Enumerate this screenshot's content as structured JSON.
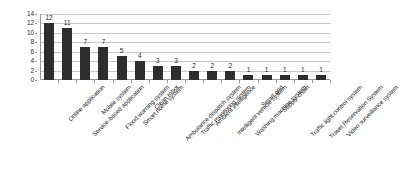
{
  "chart_data": {
    "type": "bar",
    "title": "",
    "subtitle": "",
    "xlabel": "",
    "ylabel": "",
    "ylim": [
      0,
      14
    ],
    "ytick_step": 2,
    "yticks": [
      "14",
      "12",
      "10",
      "8",
      "6",
      "4",
      "2",
      "0"
    ],
    "grid": true,
    "legend": false,
    "legend_position": "none",
    "orientation": "vertical",
    "bar_color": "#2e2e2e",
    "gridline_color": "#c9c9c9",
    "axis_color": "#9a9a9a",
    "background_color": "#ffffff",
    "categories": [
      "Online application",
      "Service-based application",
      "Mobile system",
      "Flood warning system",
      "Smart home system",
      "Clean robot",
      "Ambulance dispatch system",
      "Traffic monitoring system",
      "Ambient intelligence",
      "Intelligent vehicle system",
      "Washing machine system",
      "Smart grid",
      "Supply-chain",
      "Traffic light control system",
      "Travel Reservation  System",
      "Video surveillance system"
    ],
    "values": [
      12,
      11,
      7,
      7,
      5,
      4,
      3,
      3,
      2,
      2,
      2,
      1,
      1,
      1,
      1,
      1
    ],
    "value_labels": [
      "12",
      "11",
      "7",
      "7",
      "5",
      "4",
      "3",
      "3",
      "2",
      "2",
      "2",
      "1",
      "1",
      "1",
      "1",
      "1"
    ]
  }
}
